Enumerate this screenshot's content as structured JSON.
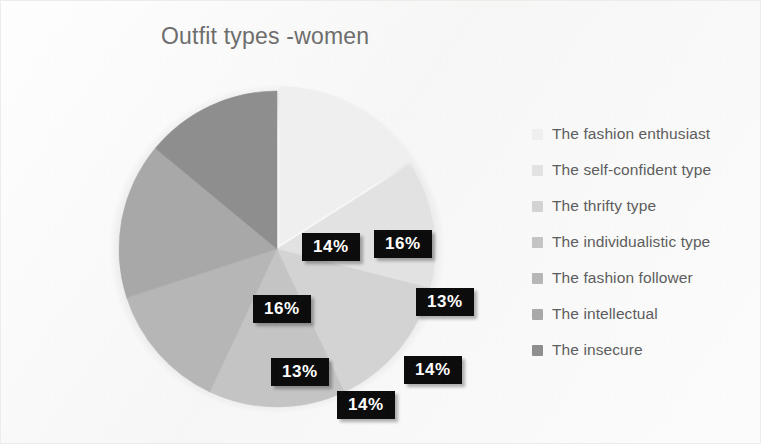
{
  "chart_data": {
    "type": "pie",
    "title": "Outfit types -women",
    "categories": [
      "The fashion enthusiast",
      "The self-confident type",
      "The thrifty type",
      "The individualistic type",
      "The fashion follower",
      "The intellectual",
      "The insecure"
    ],
    "values": [
      16,
      13,
      14,
      14,
      13,
      16,
      14
    ],
    "value_labels": [
      "16%",
      "13%",
      "14%",
      "14%",
      "13%",
      "16%",
      "14%"
    ],
    "colors": [
      "#efefef",
      "#e2e2e2",
      "#d3d3d3",
      "#c4c4c4",
      "#b6b6b6",
      "#a8a8a8",
      "#8e8e8e"
    ],
    "legend_position": "right",
    "grid": false,
    "start_angle_deg": 0,
    "label_text_color": "#ffffff",
    "label_background_color": "#0c0c0c",
    "title_color": "#6d6d6d",
    "legend_text_color": "#5d5d5d"
  },
  "chart": {
    "title": "Outfit types -women"
  },
  "legend": {
    "items": [
      {
        "label": "The fashion enthusiast",
        "color": "#efefef"
      },
      {
        "label": "The self-confident type",
        "color": "#e2e2e2"
      },
      {
        "label": "The thrifty type",
        "color": "#d3d3d3"
      },
      {
        "label": "The individualistic type",
        "color": "#c4c4c4"
      },
      {
        "label": "The fashion follower",
        "color": "#b6b6b6"
      },
      {
        "label": "The intellectual",
        "color": "#a8a8a8"
      },
      {
        "label": "The insecure",
        "color": "#8e8e8e"
      }
    ]
  },
  "labels": [
    {
      "text": "16%",
      "x": 273,
      "y": 157
    },
    {
      "text": "13%",
      "x": 315,
      "y": 215
    },
    {
      "text": "14%",
      "x": 303,
      "y": 283
    },
    {
      "text": "14%",
      "x": 236,
      "y": 318
    },
    {
      "text": "13%",
      "x": 170,
      "y": 285
    },
    {
      "text": "16%",
      "x": 152,
      "y": 222
    },
    {
      "text": "14%",
      "x": 201,
      "y": 160
    }
  ]
}
